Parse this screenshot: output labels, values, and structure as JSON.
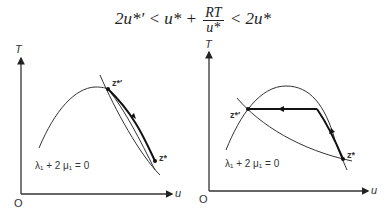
{
  "formula": {
    "lhs": "2u*′ < u* + ",
    "frac_num": "RT",
    "frac_den": "u*",
    "rhs": " < 2u*"
  },
  "panels": [
    {
      "y_axis_label": "T",
      "x_axis_label": "u",
      "origin_label": "O",
      "point_upper_label": "z*′",
      "point_lower_label": "z*",
      "equation_label": "λ₁ + 2 μ₁ = 0"
    },
    {
      "y_axis_label": "T",
      "x_axis_label": "u",
      "origin_label": "O",
      "point_upper_label": "z*′",
      "point_lower_label": "z*",
      "equation_label": "λ₁ + 2 μ₁ = 0"
    }
  ],
  "colors": {
    "ink": "#222222",
    "background": "#ffffff"
  }
}
